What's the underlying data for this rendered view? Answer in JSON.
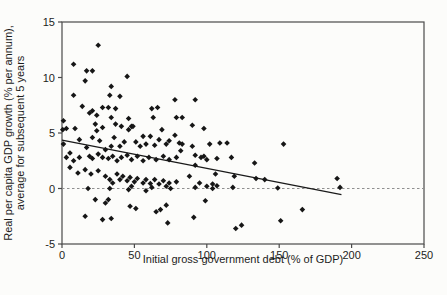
{
  "chart_data": {
    "type": "scatter",
    "title": "",
    "xlabel": "Initial gross government debt (% of GDP)",
    "ylabel_line1": "Real per capita GDP growth (% per annum),",
    "ylabel_line2": "average for subsequent 5 years",
    "xlim": [
      0,
      250
    ],
    "ylim": [
      -5,
      15
    ],
    "xticks": [
      0,
      50,
      100,
      150,
      200,
      250
    ],
    "yticks": [
      -5,
      0,
      5,
      10,
      15
    ],
    "grid": false,
    "legend_position": "none",
    "marker": "diamond",
    "marker_color": "#161616",
    "frame_color": "#4a4a4a",
    "zero_line": {
      "y": 0,
      "style": "dashed",
      "color": "#8f8f8f"
    },
    "trend_line": {
      "x1": 0,
      "y1": 4.35,
      "x2": 193,
      "y2": -0.55,
      "color": "#1a1a1a"
    },
    "points": [
      [
        25,
        12.9
      ],
      [
        8,
        11.2
      ],
      [
        17,
        10.6
      ],
      [
        21,
        10.6
      ],
      [
        16,
        9.7
      ],
      [
        45,
        10.1
      ],
      [
        34,
        9.2
      ],
      [
        8,
        8.4
      ],
      [
        33,
        8.4
      ],
      [
        40,
        8.3
      ],
      [
        78,
        8.0
      ],
      [
        92,
        8.0
      ],
      [
        14,
        7.4
      ],
      [
        21,
        7.0
      ],
      [
        19,
        6.8
      ],
      [
        28,
        7.3
      ],
      [
        32,
        7.3
      ],
      [
        37,
        7.2
      ],
      [
        62,
        7.2
      ],
      [
        66,
        7.3
      ],
      [
        24,
        6.6
      ],
      [
        34,
        6.4
      ],
      [
        46,
        6.3
      ],
      [
        63,
        6.4
      ],
      [
        79,
        6.4
      ],
      [
        83,
        6.4
      ],
      [
        1,
        6.1
      ],
      [
        23,
        5.8
      ],
      [
        37,
        5.8
      ],
      [
        48,
        5.6
      ],
      [
        90,
        5.7
      ],
      [
        98,
        5.4
      ],
      [
        0.5,
        5.3
      ],
      [
        3,
        5.4
      ],
      [
        9,
        5.4
      ],
      [
        24,
        5.2
      ],
      [
        28,
        5.5
      ],
      [
        41,
        5.6
      ],
      [
        46,
        5.3
      ],
      [
        49,
        5.6
      ],
      [
        69,
        5.3
      ],
      [
        1,
        4.0
      ],
      [
        5.5,
        3.2
      ],
      [
        12,
        4.4
      ],
      [
        17,
        3.7
      ],
      [
        21,
        4.6
      ],
      [
        26,
        4.3
      ],
      [
        30,
        3.5
      ],
      [
        34,
        3.8
      ],
      [
        36,
        4.6
      ],
      [
        40,
        3.8
      ],
      [
        43,
        4.2
      ],
      [
        51,
        4.2
      ],
      [
        54,
        3.8
      ],
      [
        56,
        4.7
      ],
      [
        61,
        4.7
      ],
      [
        58,
        4.0
      ],
      [
        64,
        3.9
      ],
      [
        67,
        4.4
      ],
      [
        72,
        4.0
      ],
      [
        74,
        4.3
      ],
      [
        78,
        4.8
      ],
      [
        81,
        4.1
      ],
      [
        3,
        2.8
      ],
      [
        8,
        2.5
      ],
      [
        12,
        2.8
      ],
      [
        19,
        2.9
      ],
      [
        21,
        2.7
      ],
      [
        25,
        3.1
      ],
      [
        28,
        2.8
      ],
      [
        32,
        2.7
      ],
      [
        35,
        2.9
      ],
      [
        38,
        2.5
      ],
      [
        41,
        2.8
      ],
      [
        45,
        3.0
      ],
      [
        48,
        2.6
      ],
      [
        52,
        2.9
      ],
      [
        56,
        2.5
      ],
      [
        60,
        2.8
      ],
      [
        65,
        2.6
      ],
      [
        70,
        2.9
      ],
      [
        74,
        2.6
      ],
      [
        79,
        2.8
      ],
      [
        5.5,
        1.9
      ],
      [
        11,
        1.4
      ],
      [
        16,
        1.7
      ],
      [
        20,
        1.3
      ],
      [
        25,
        1.6
      ],
      [
        30,
        1.1
      ],
      [
        33,
        0.8
      ],
      [
        35,
        0.5
      ],
      [
        38,
        1.3
      ],
      [
        40,
        0.8
      ],
      [
        42,
        1.1
      ],
      [
        45,
        0.7
      ],
      [
        47,
        1.0
      ],
      [
        50,
        0.6
      ],
      [
        52,
        0.9
      ],
      [
        56,
        0.5
      ],
      [
        58,
        0.8
      ],
      [
        61,
        0.45
      ],
      [
        64,
        0.8
      ],
      [
        67,
        0.4
      ],
      [
        70,
        0.7
      ],
      [
        74,
        0.5
      ],
      [
        79,
        0.6
      ],
      [
        18,
        0.0
      ],
      [
        33,
        0.0
      ],
      [
        46,
        -0.1
      ],
      [
        48,
        0.2
      ],
      [
        58,
        -0.2
      ],
      [
        62,
        0.1
      ],
      [
        72,
        0.2
      ],
      [
        75,
        0.0
      ],
      [
        23,
        -1.0
      ],
      [
        30,
        -1.3
      ],
      [
        32,
        -1.0
      ],
      [
        47,
        -1.6
      ],
      [
        51,
        -1.8
      ],
      [
        16,
        -2.5
      ],
      [
        28,
        -2.8
      ],
      [
        34,
        -2.7
      ],
      [
        65,
        -2.1
      ],
      [
        68,
        -1.9
      ],
      [
        72,
        -1.5
      ],
      [
        73,
        -3.1
      ],
      [
        83,
        4.0
      ],
      [
        82,
        3.4
      ],
      [
        90,
        3.8
      ],
      [
        102,
        4.0
      ],
      [
        109,
        4.1
      ],
      [
        114,
        4.1
      ],
      [
        153,
        4.0
      ],
      [
        92,
        3.0
      ],
      [
        96,
        2.8
      ],
      [
        98,
        2.9
      ],
      [
        100,
        2.6
      ],
      [
        107,
        2.7
      ],
      [
        117,
        2.8
      ],
      [
        133,
        2.3
      ],
      [
        92,
        2.1
      ],
      [
        106,
        1.3
      ],
      [
        119,
        1.1
      ],
      [
        88,
        1.1
      ],
      [
        95,
        0.5
      ],
      [
        104,
        0.4
      ],
      [
        134,
        0.9
      ],
      [
        140,
        0.8
      ],
      [
        92,
        0.1
      ],
      [
        100,
        0.2
      ],
      [
        104,
        0.0
      ],
      [
        107,
        0.25
      ],
      [
        118,
        0.1
      ],
      [
        149,
        0.05
      ],
      [
        99,
        -1.1
      ],
      [
        91,
        -2.6
      ],
      [
        120,
        -3.6
      ],
      [
        124,
        -3.3
      ],
      [
        151,
        -2.9
      ],
      [
        166,
        -1.9
      ],
      [
        190,
        0.9
      ],
      [
        192,
        0.1
      ]
    ]
  }
}
